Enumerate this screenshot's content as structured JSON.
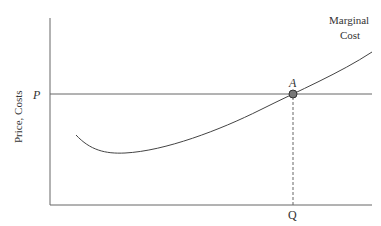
{
  "diagram": {
    "type": "economics-marginal-cost",
    "y_axis_label": "Price, Costs",
    "x_axis_label": "",
    "price_label": "P",
    "quantity_label": "Q",
    "point_label": "A",
    "curve_label_line1": "Marginal",
    "curve_label_line2": "Cost",
    "colors": {
      "axes": "#555555",
      "curve": "#444444",
      "point_fill": "#666666",
      "dashed": "#555555"
    }
  }
}
